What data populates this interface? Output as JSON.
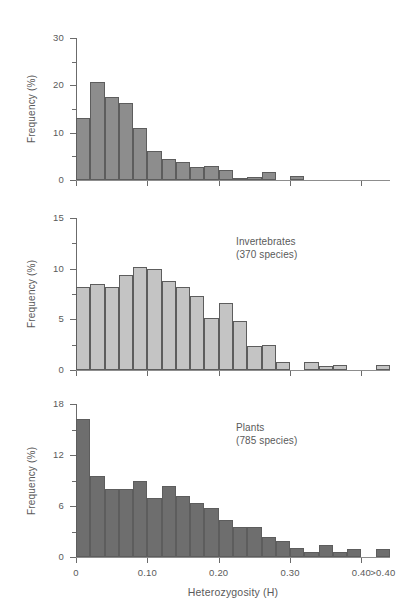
{
  "figure": {
    "axis_title_y": "Frequency (%)",
    "axis_title_x": "Heterozygosity (H)",
    "x_tick_labels": [
      "0",
      "0.10",
      "0.20",
      "0.30",
      "0.40",
      ">0.40"
    ]
  },
  "chart_data": [
    {
      "type": "bar",
      "title": "",
      "xlabel": "",
      "ylabel": "Frequency (%)",
      "bar_color": "#8d8d8d",
      "ylim": [
        0,
        30
      ],
      "y_ticks": [
        0,
        10,
        20,
        30
      ],
      "y_tick_labels": [
        "0",
        "10",
        "20",
        "30"
      ],
      "y_minor_ticks": [
        5,
        15,
        25
      ],
      "grid": false,
      "bin_width": 0.02,
      "categories": [
        "0.00-0.02",
        "0.02-0.04",
        "0.04-0.06",
        "0.06-0.08",
        "0.08-0.10",
        "0.10-0.12",
        "0.12-0.14",
        "0.14-0.16",
        "0.16-0.18",
        "0.18-0.20",
        "0.20-0.22",
        "0.22-0.24",
        "0.24-0.26",
        "0.26-0.28",
        "0.28-0.30",
        "0.30-0.32",
        "0.32-0.34",
        "0.34-0.36",
        "0.36-0.38",
        "0.38-0.40",
        ">0.40"
      ],
      "values": [
        13.2,
        20.7,
        17.6,
        16.2,
        11.0,
        6.1,
        4.5,
        3.8,
        2.8,
        2.9,
        2.1,
        0.5,
        0.6,
        1.6,
        0.0,
        0.9,
        0.0,
        0.0,
        0.0,
        0.0,
        0.0
      ]
    },
    {
      "type": "bar",
      "title": "Invertebrates",
      "subtitle": "(370 species)",
      "xlabel": "",
      "ylabel": "Frequency (%)",
      "bar_color": "#c4c4c4",
      "ylim": [
        0,
        15
      ],
      "y_ticks": [
        0,
        5,
        10,
        15
      ],
      "y_tick_labels": [
        "0",
        "5",
        "10",
        "15"
      ],
      "y_minor_ticks": [
        2.5,
        7.5,
        12.5
      ],
      "grid": false,
      "bin_width": 0.02,
      "categories": [
        "0.00-0.02",
        "0.02-0.04",
        "0.04-0.06",
        "0.06-0.08",
        "0.08-0.10",
        "0.10-0.12",
        "0.12-0.14",
        "0.14-0.16",
        "0.16-0.18",
        "0.18-0.20",
        "0.20-0.22",
        "0.22-0.24",
        "0.24-0.26",
        "0.26-0.28",
        "0.28-0.30",
        "0.30-0.32",
        "0.32-0.34",
        "0.34-0.36",
        "0.36-0.38",
        "0.38-0.40",
        ">0.40"
      ],
      "values": [
        8.2,
        8.5,
        8.2,
        9.4,
        10.2,
        10.0,
        8.8,
        8.2,
        7.3,
        5.1,
        6.6,
        4.8,
        2.4,
        2.5,
        0.8,
        0.0,
        0.8,
        0.4,
        0.5,
        0.0,
        0.5
      ]
    },
    {
      "type": "bar",
      "title": "Plants",
      "subtitle": "(785 species)",
      "xlabel": "Heterozygosity (H)",
      "ylabel": "Frequency (%)",
      "bar_color": "#6e6e6e",
      "ylim": [
        0,
        18
      ],
      "y_ticks": [
        0,
        6,
        12,
        18
      ],
      "y_tick_labels": [
        "0",
        "6",
        "12",
        "18"
      ],
      "y_minor_ticks": [
        3,
        9,
        15
      ],
      "grid": false,
      "bin_width": 0.02,
      "categories": [
        "0.00-0.02",
        "0.02-0.04",
        "0.04-0.06",
        "0.06-0.08",
        "0.08-0.10",
        "0.10-0.12",
        "0.12-0.14",
        "0.14-0.16",
        "0.16-0.18",
        "0.18-0.20",
        "0.20-0.22",
        "0.22-0.24",
        "0.24-0.26",
        "0.26-0.28",
        "0.28-0.30",
        "0.30-0.32",
        "0.32-0.34",
        "0.34-0.36",
        "0.36-0.38",
        "0.38-0.40",
        ">0.40"
      ],
      "values": [
        16.2,
        9.5,
        8.0,
        8.0,
        9.0,
        7.0,
        8.3,
        7.2,
        6.4,
        5.8,
        4.4,
        3.5,
        3.5,
        2.4,
        1.9,
        1.1,
        0.6,
        1.4,
        0.6,
        0.9,
        0.9
      ]
    }
  ]
}
